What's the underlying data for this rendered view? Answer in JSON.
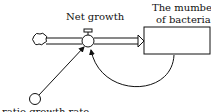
{
  "diagram": {
    "type": "stock-and-flow",
    "flow_label": "Net growth",
    "stock_label_line1": "The mumber",
    "stock_label_line2": "of bacteria",
    "auxiliary_label": "ratio growth rate",
    "colors": {
      "stroke": "#111111",
      "background": "#ffffff"
    }
  }
}
